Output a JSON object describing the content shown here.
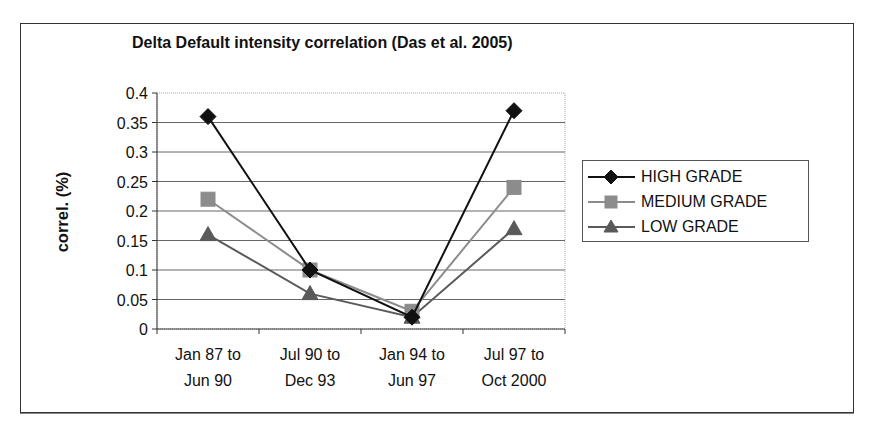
{
  "chart_data": {
    "type": "line",
    "title": "Delta Default intensity correlation (Das et al. 2005)",
    "xlabel": "",
    "ylabel": "correl. (%)",
    "ylim": [
      0,
      0.4
    ],
    "y_ticks": [
      "0",
      "0.05",
      "0.1",
      "0.15",
      "0.2",
      "0.25",
      "0.3",
      "0.35",
      "0.4"
    ],
    "grid": true,
    "legend_position": "right",
    "categories": [
      [
        "Jan 87 to",
        "Jun 90"
      ],
      [
        "Jul 90 to",
        "Dec 93"
      ],
      [
        "Jan 94 to",
        "Jun 97"
      ],
      [
        "Jul 97 to",
        "Oct 2000"
      ]
    ],
    "series": [
      {
        "name": "HIGH GRADE",
        "marker": "diamond",
        "color": "#111111",
        "values": [
          0.36,
          0.1,
          0.02,
          0.37
        ]
      },
      {
        "name": "MEDIUM GRADE",
        "marker": "square",
        "color": "#8c8c8c",
        "values": [
          0.22,
          0.1,
          0.03,
          0.24
        ]
      },
      {
        "name": "LOW GRADE",
        "marker": "triangle",
        "color": "#5a5a5a",
        "values": [
          0.16,
          0.06,
          0.02,
          0.17
        ]
      }
    ]
  }
}
